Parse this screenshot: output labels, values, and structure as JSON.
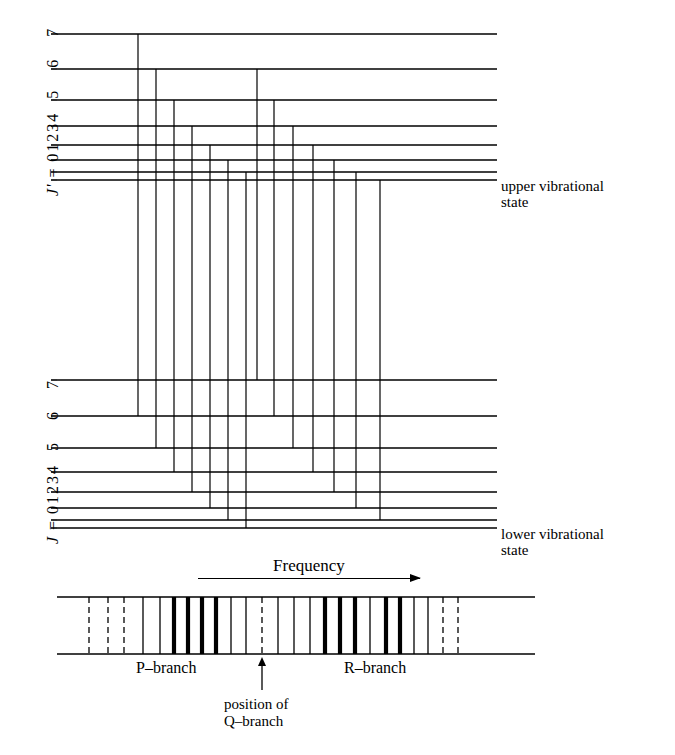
{
  "figure": {
    "title_present": false,
    "colors": {
      "ink": "#000000",
      "background": "#ffffff"
    }
  },
  "upper_state": {
    "axis_label": "J' = 0 1 2 3 4 5 6 7",
    "axis_label_prefix": "J' =",
    "quantum_numbers": [
      "0",
      "1",
      "2",
      "3",
      "4",
      "5",
      "6",
      "7"
    ],
    "annotation": "upper vibrational\nstate",
    "levels": [
      {
        "J": "0",
        "y": 180
      },
      {
        "J": "1",
        "y": 172
      },
      {
        "J": "2",
        "y": 160
      },
      {
        "J": "3",
        "y": 145
      },
      {
        "J": "4",
        "y": 126
      },
      {
        "J": "5",
        "y": 100
      },
      {
        "J": "6",
        "y": 69
      },
      {
        "J": "7",
        "y": 34
      }
    ]
  },
  "lower_state": {
    "axis_label": "J = 0 1 2 3 4 5 6 7",
    "axis_label_prefix": "J =",
    "quantum_numbers": [
      "0",
      "1",
      "2",
      "3",
      "4",
      "5",
      "6",
      "7"
    ],
    "annotation": "lower vibrational\nstate",
    "levels": [
      {
        "J": "0",
        "y": 528
      },
      {
        "J": "1",
        "y": 520
      },
      {
        "J": "2",
        "y": 508
      },
      {
        "J": "3",
        "y": 492
      },
      {
        "J": "4",
        "y": 472
      },
      {
        "J": "5",
        "y": 448
      },
      {
        "J": "6",
        "y": 416
      },
      {
        "J": "7",
        "y": 380
      }
    ]
  },
  "level_lines": {
    "x_start": 57,
    "x_end": 497
  },
  "transitions": {
    "p_branch": [
      {
        "label": "P(1)",
        "x": 380,
        "upper_J": "0",
        "lower_J": "1"
      },
      {
        "label": "P(2)",
        "x": 356,
        "upper_J": "1",
        "lower_J": "2"
      },
      {
        "label": "P(3)",
        "x": 334,
        "upper_J": "2",
        "lower_J": "3"
      },
      {
        "label": "P(4)",
        "x": 313,
        "upper_J": "3",
        "lower_J": "4"
      },
      {
        "label": "P(5)",
        "x": 293,
        "upper_J": "4",
        "lower_J": "5"
      },
      {
        "label": "P(6)",
        "x": 274,
        "upper_J": "5",
        "lower_J": "6"
      },
      {
        "label": "P(7)",
        "x": 257,
        "upper_J": "6",
        "lower_J": "7"
      }
    ],
    "r_branch": [
      {
        "label": "R(0)",
        "x": 246,
        "upper_J": "1",
        "lower_J": "0"
      },
      {
        "label": "R(1)",
        "x": 228,
        "upper_J": "2",
        "lower_J": "1"
      },
      {
        "label": "R(2)",
        "x": 210,
        "upper_J": "3",
        "lower_J": "2"
      },
      {
        "label": "R(3)",
        "x": 192,
        "upper_J": "4",
        "lower_J": "3"
      },
      {
        "label": "R(4)",
        "x": 174,
        "upper_J": "5",
        "lower_J": "4"
      },
      {
        "label": "R(5)",
        "x": 156,
        "upper_J": "6",
        "lower_J": "5"
      },
      {
        "label": "R(6)",
        "x": 138,
        "upper_J": "7",
        "lower_J": "6"
      }
    ]
  },
  "frequency_axis": {
    "label": "Frequency",
    "direction": "right",
    "x_start": 198,
    "x_end": 420,
    "y": 580
  },
  "spectrum": {
    "box": {
      "x": 57,
      "y": 597,
      "width": 478,
      "height": 57
    },
    "q_branch_marker": {
      "x": 262,
      "style": "dashed"
    },
    "lines": [
      {
        "x": 89,
        "style": "dashed",
        "weight": "thin"
      },
      {
        "x": 108,
        "style": "dashed",
        "weight": "thin"
      },
      {
        "x": 124,
        "style": "dashed",
        "weight": "thin"
      },
      {
        "x": 143,
        "style": "solid",
        "weight": "thin"
      },
      {
        "x": 160,
        "style": "solid",
        "weight": "thin"
      },
      {
        "x": 174,
        "style": "solid",
        "weight": "bold"
      },
      {
        "x": 188,
        "style": "solid",
        "weight": "bold"
      },
      {
        "x": 202,
        "style": "solid",
        "weight": "bold"
      },
      {
        "x": 216,
        "style": "solid",
        "weight": "bold"
      },
      {
        "x": 231,
        "style": "solid",
        "weight": "thin"
      },
      {
        "x": 246,
        "style": "solid",
        "weight": "thin"
      },
      {
        "x": 262,
        "style": "dashed",
        "weight": "thin"
      },
      {
        "x": 278,
        "style": "solid",
        "weight": "thin"
      },
      {
        "x": 294,
        "style": "solid",
        "weight": "thin"
      },
      {
        "x": 310,
        "style": "solid",
        "weight": "thin"
      },
      {
        "x": 325,
        "style": "solid",
        "weight": "bold"
      },
      {
        "x": 340,
        "style": "solid",
        "weight": "bold"
      },
      {
        "x": 355,
        "style": "solid",
        "weight": "bold"
      },
      {
        "x": 370,
        "style": "solid",
        "weight": "thin"
      },
      {
        "x": 386,
        "style": "solid",
        "weight": "bold"
      },
      {
        "x": 400,
        "style": "solid",
        "weight": "bold"
      },
      {
        "x": 414,
        "style": "solid",
        "weight": "thin"
      },
      {
        "x": 428,
        "style": "solid",
        "weight": "thin"
      },
      {
        "x": 443,
        "style": "dashed",
        "weight": "thin"
      },
      {
        "x": 458,
        "style": "dashed",
        "weight": "thin"
      }
    ],
    "p_branch_label": "P–branch",
    "r_branch_label": "R–branch",
    "q_branch_note": "position of\nQ–branch",
    "q_pointer": {
      "x": 262,
      "y_top": 657,
      "y_bottom": 690
    }
  }
}
